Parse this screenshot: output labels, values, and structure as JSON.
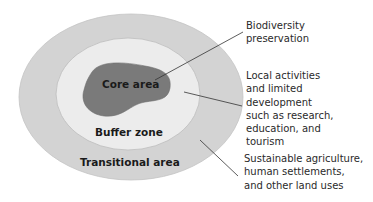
{
  "diagram": {
    "zones": [
      {
        "label": "Core area",
        "color": "#7a7a7a"
      },
      {
        "label": "Buffer zone",
        "color": "#ececec"
      },
      {
        "label": "Transitional area",
        "color": "#d3d3d3"
      }
    ],
    "descriptions": [
      {
        "zone": "Core area",
        "text": "Biodiversity\npreservation"
      },
      {
        "zone": "Buffer zone",
        "text": "Local activities\nand limited\ndevelopment\nsuch as research,\neducation, and\ntourism"
      },
      {
        "zone": "Transitional area",
        "text": "Sustainable agriculture,\nhuman settlements,\nand other land uses"
      }
    ]
  }
}
